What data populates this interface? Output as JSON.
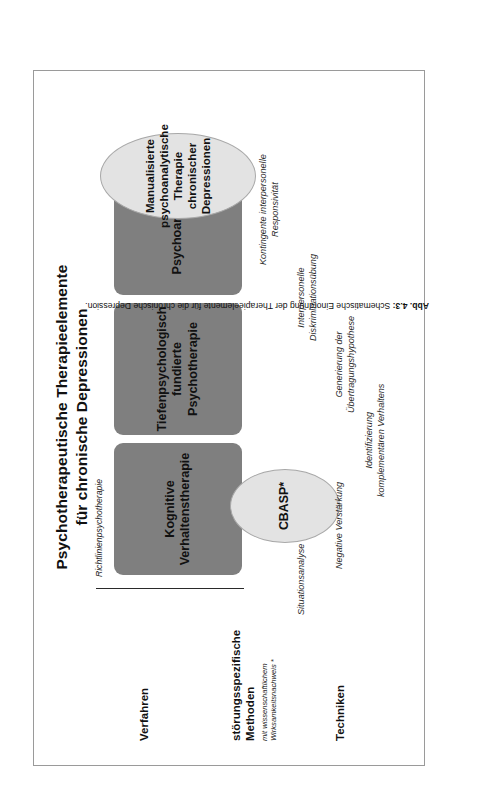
{
  "figure": {
    "title": "Psychotherapeutische Therapieelemente\nfür chronische Depressionen",
    "bracket_label": "Richtlinienpsychotherapie",
    "caption_prefix": "Abb. 4.3:",
    "caption_text": "Schematische Einordnung der Therapieelemente für die chronische Depression."
  },
  "row_labels": {
    "verfahren": "Verfahren",
    "methoden": "störungsspezifische\nMethoden",
    "methoden_sub": "mit wissenschaftlichem\nWirksamkeitsnachweis *",
    "techniken": "Techniken"
  },
  "verfahren_boxes": [
    {
      "id": "kvt",
      "label": "Kognitive\nVerhaltenstherapie"
    },
    {
      "id": "tfp",
      "label": "Tiefenpsychologisch\nfundierte\nPsychotherapie"
    },
    {
      "id": "pa",
      "label": "Psychoanalyse"
    }
  ],
  "methoden_ellipses": [
    {
      "id": "cbasp",
      "label": "CBASP*"
    },
    {
      "id": "mapct",
      "label": "Manualisierte\npsychoanalytische\nTherapie chronischer\nDepressionen"
    }
  ],
  "techniken": [
    "Situationsanalyse",
    "Negative Verstärkung",
    "Identifizierung\nkomplementären Verhaltens",
    "Generierung der\nÜbertragungshypothese",
    "Interpersonelle\nDiskriminationsübung",
    "Kontingente interpersonelle\nResponsivität"
  ],
  "colors": {
    "verfahren_box_fill": "#7f7f7f",
    "methoden_ellipse_fill": "#e3e3e3",
    "frame_border": "#9a9a9a",
    "text": "#111111"
  }
}
